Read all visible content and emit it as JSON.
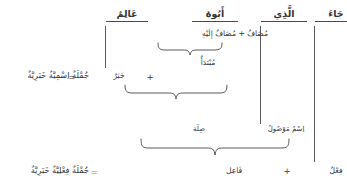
{
  "diagram": {
    "language": "ar",
    "direction": "rtl",
    "ink_color": "#343434",
    "rule_color": "#4a4a4a",
    "background": "#ffffff",
    "head_words": [
      {
        "id": "jaa",
        "text": "جَاءَ"
      },
      {
        "id": "alladhi",
        "text": "الَّذِي"
      },
      {
        "id": "abuuhu",
        "text": "أَبُوهُ"
      },
      {
        "id": "aalimun",
        "text": "عَالِمٌ"
      }
    ],
    "annotations": {
      "mudaf_pair": "مُضَافٌ + مُضَافٌ إِلَيْهِ",
      "mubtada": "مُبْتَدَأٌ",
      "khabar": "خَبَرٌ",
      "ism_mawsul": "اِسْمٌ مَوْصُولٌ",
      "sila": "صِلَة",
      "fail": "فَاعِل",
      "fil": "فِعْلٌ"
    },
    "operators": {
      "plus_nominal": "+",
      "equals_nominal": "=",
      "plus_verbal": "+",
      "equals_verbal": "="
    },
    "results": {
      "nominal_sentence": "جُمْلَةٌ اِسْمِيَّةٌ خَبَرِيَّةٌ",
      "verbal_sentence": "جُمْلَةٌ فِعْلِيَّةٌ خَبَرِيَّةٌ"
    }
  }
}
